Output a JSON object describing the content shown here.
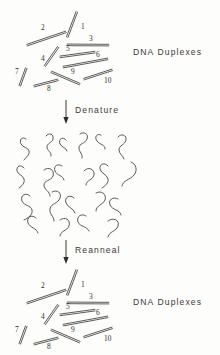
{
  "figure": {
    "title_top": "DNA Duplexes",
    "title_bottom": "DNA Duplexes",
    "step_one_label": "Denature",
    "step_two_label": "Reanneal",
    "ink_color": "#3d3b39",
    "paper_color": "#fdfdfb"
  },
  "duplex_numbers": {
    "n1": "1",
    "n2": "2",
    "n3": "3",
    "n4": "4",
    "n5": "5",
    "n6": "6",
    "n7": "7",
    "n8": "8",
    "n9": "9",
    "n10": "10"
  },
  "chart_data": {
    "type": "diagram",
    "stages": [
      {
        "name": "DNA Duplexes",
        "state": "double-stranded",
        "count": 10,
        "labels": [
          "1",
          "2",
          "3",
          "4",
          "5",
          "6",
          "7",
          "8",
          "9",
          "10"
        ]
      },
      {
        "name": "Denatured",
        "state": "single-stranded",
        "count": 20,
        "labels": []
      },
      {
        "name": "DNA Duplexes",
        "state": "double-stranded",
        "count": 10,
        "labels": [
          "1",
          "2",
          "3",
          "4",
          "5",
          "6",
          "7",
          "8",
          "9",
          "10"
        ]
      }
    ],
    "transitions": [
      "Denature",
      "Reanneal"
    ],
    "duplexes_top": [
      {
        "id": "1",
        "x1": 77,
        "y1": 12,
        "x2": 67,
        "y2": 37,
        "label_x": 81,
        "label_y": 29
      },
      {
        "id": "2",
        "x1": 27,
        "y1": 45,
        "x2": 66,
        "y2": 32,
        "label_x": 41,
        "label_y": 30
      },
      {
        "id": "3",
        "x1": 67,
        "y1": 45,
        "x2": 109,
        "y2": 45,
        "label_x": 89,
        "label_y": 41
      },
      {
        "id": "4",
        "x1": 45,
        "y1": 66,
        "x2": 58,
        "y2": 47,
        "label_x": 41,
        "label_y": 61
      },
      {
        "id": "5",
        "x1": 60,
        "y1": 57,
        "x2": 95,
        "y2": 52,
        "label_x": 66,
        "label_y": 51
      },
      {
        "id": "6",
        "x1": 63,
        "y1": 67,
        "x2": 108,
        "y2": 59,
        "label_x": 96,
        "label_y": 57
      },
      {
        "id": "7",
        "x1": 20,
        "y1": 86,
        "x2": 26,
        "y2": 68,
        "label_x": 15,
        "label_y": 74
      },
      {
        "id": "8",
        "x1": 34,
        "y1": 86,
        "x2": 58,
        "y2": 80,
        "label_x": 47,
        "label_y": 91
      },
      {
        "id": "9",
        "x1": 51,
        "y1": 72,
        "x2": 80,
        "y2": 84,
        "label_x": 71,
        "label_y": 74
      },
      {
        "id": "10",
        "x1": 84,
        "y1": 79,
        "x2": 112,
        "y2": 70,
        "label_x": 104,
        "label_y": 83
      }
    ],
    "duplexes_bottom": [
      {
        "id": "1",
        "x1": 77,
        "y1": 270,
        "x2": 67,
        "y2": 295,
        "label_x": 81,
        "label_y": 287
      },
      {
        "id": "2",
        "x1": 27,
        "y1": 303,
        "x2": 66,
        "y2": 290,
        "label_x": 41,
        "label_y": 288
      },
      {
        "id": "3",
        "x1": 67,
        "y1": 303,
        "x2": 109,
        "y2": 303,
        "label_x": 89,
        "label_y": 299
      },
      {
        "id": "4",
        "x1": 45,
        "y1": 324,
        "x2": 58,
        "y2": 305,
        "label_x": 41,
        "label_y": 319
      },
      {
        "id": "5",
        "x1": 60,
        "y1": 315,
        "x2": 95,
        "y2": 310,
        "label_x": 66,
        "label_y": 309
      },
      {
        "id": "6",
        "x1": 63,
        "y1": 325,
        "x2": 108,
        "y2": 317,
        "label_x": 96,
        "label_y": 315
      },
      {
        "id": "7",
        "x1": 20,
        "y1": 344,
        "x2": 26,
        "y2": 326,
        "label_x": 15,
        "label_y": 332
      },
      {
        "id": "8",
        "x1": 34,
        "y1": 344,
        "x2": 58,
        "y2": 338,
        "label_x": 47,
        "label_y": 349
      },
      {
        "id": "9",
        "x1": 51,
        "y1": 330,
        "x2": 80,
        "y2": 342,
        "label_x": 71,
        "label_y": 332
      },
      {
        "id": "10",
        "x1": 84,
        "y1": 337,
        "x2": 112,
        "y2": 328,
        "label_x": 104,
        "label_y": 341
      }
    ],
    "strands": [
      "M26,139 c-4,-3 -7,1 -5,5 c2,4 7,3 8,7 c1,4 -3,6 -5,9",
      "M46,136 c3,-4 8,-2 7,3 c-1,4 -6,4 -6,8 c0,4 5,5 4,9",
      "M66,140 c-3,-4 -8,-1 -6,4 c2,4 6,3 7,7",
      "M80,134 c4,-3 9,0 7,5 c-2,5 -8,4 -8,9 c0,4 4,6 3,10",
      "M101,135 c-4,-2 -7,2 -4,6 c3,4 8,3 8,8",
      "M118,137 c3,-4 9,-2 8,3 c-1,5 -7,5 -7,10 c0,4 4,5 5,9",
      "M24,168 c-3,-4 -8,-2 -7,3 c1,4 6,4 7,8 c1,4 -2,7 -5,9",
      "M44,170 c5,-4 11,0 9,6 c-2,5 -9,4 -9,9 c0,5 6,6 6,11",
      "M62,166 c-4,-3 -9,0 -7,5 c2,5 8,4 9,9",
      "M84,171 c4,-5 11,-2 10,4 c-1,5 -8,5 -8,10",
      "M108,166 c-3,-4 -9,-2 -8,3 c1,5 7,5 8,10 c1,4 -3,7 -6,9",
      "M131,162 c5,2 7,8 3,13 c-4,5 -11,5 -12,11",
      "M30,196 c-4,-4 -10,-1 -8,5 c2,5 9,4 10,9 c1,5 -4,8 -8,10",
      "M52,192 c5,-3 10,1 8,6 c-2,6 -9,5 -10,11 c-1,5 4,7 4,12",
      "M74,198 c-4,-4 -10,-1 -8,5 c2,5 8,5 9,10",
      "M96,193 c5,-3 11,1 9,7 c-2,5 -9,5 -9,11",
      "M118,199 c-5,-3 -10,1 -8,6 c3,6 10,4 11,10",
      "M36,218 c-4,-4 -10,-1 -8,5 c2,5 9,5 10,10",
      "M60,220 c5,-4 11,0 9,6 c-2,5 -9,5 -9,10",
      "M86,216 c-4,-3 -10,0 -8,6 c2,5 9,4 11,9",
      "M108,221 c5,-4 12,-1 10,5 c-2,6 -9,5 -10,11"
    ]
  },
  "arrows": [
    {
      "label": "Denature",
      "x": 66,
      "y_from": 100,
      "y_to": 124,
      "label_x": 75,
      "label_y": 110
    },
    {
      "label": "Reanneal",
      "x": 66,
      "y_from": 240,
      "y_to": 264,
      "label_x": 75,
      "label_y": 250
    }
  ]
}
